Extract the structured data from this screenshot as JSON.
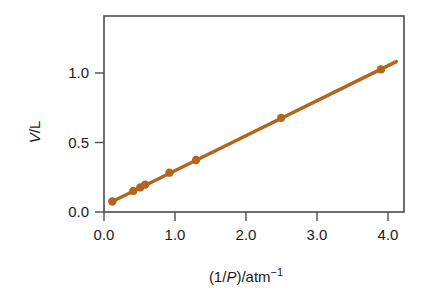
{
  "chart_data": {
    "type": "scatter",
    "title": "",
    "subtitle": "",
    "xlabel_parts": {
      "pre": "(1/",
      "italic": "P",
      "post": ")/atm",
      "superscript": "−1"
    },
    "xlabel": "(1/P)/atm−1",
    "ylabel_parts": {
      "italic": "V",
      "post": "/L"
    },
    "ylabel": "V/L",
    "xlim": [
      -0.12,
      4.18
    ],
    "ylim": [
      -0.075,
      1.32
    ],
    "xticks": [
      0.0,
      1.0,
      2.0,
      3.0,
      4.0
    ],
    "xtick_labels": [
      "0.0",
      "1.0",
      "2.0",
      "3.0",
      "4.0"
    ],
    "yticks": [
      0.0,
      0.5,
      1.0
    ],
    "ytick_labels": [
      "0.0",
      "0.5",
      "1.0"
    ],
    "grid": false,
    "legend": null,
    "series": [
      {
        "name": "V vs 1/P",
        "color": "#b3651e",
        "marker": "circle",
        "line": true,
        "x": [
          0.0,
          0.3,
          0.4,
          0.47,
          0.82,
          1.2,
          2.42,
          3.85
        ],
        "y": [
          0.0,
          0.075,
          0.1,
          0.12,
          0.205,
          0.295,
          0.595,
          0.94
        ]
      }
    ],
    "fit_line": {
      "slope": 0.2445,
      "intercept": 0.0,
      "x_start": 0.0,
      "x_end": 4.07,
      "color": "#b3651e"
    },
    "colors": {
      "data": "#b3651e",
      "axis": "#4d4d4d",
      "text": "#1a1a1a",
      "background": "#ffffff"
    }
  },
  "figure": {
    "marker_radius_px": 4.2,
    "line_width_px": 3.4
  }
}
